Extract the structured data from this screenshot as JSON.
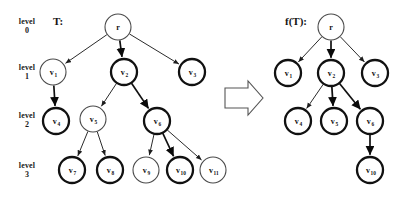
{
  "figure": {
    "level_labels": [
      {
        "line1": "level",
        "line2": "0"
      },
      {
        "line1": "level",
        "line2": "1"
      },
      {
        "line1": "level",
        "line2": "2"
      },
      {
        "line1": "level",
        "line2": "3"
      }
    ],
    "left_tree": {
      "caption": "T:",
      "nodes": [
        {
          "id": "r",
          "base": "r",
          "sub": "",
          "level": 0,
          "x": 118,
          "y": 27,
          "bold": false
        },
        {
          "id": "v1",
          "base": "v",
          "sub": "1",
          "level": 1,
          "x": 53,
          "y": 72,
          "bold": false
        },
        {
          "id": "v2",
          "base": "v",
          "sub": "2",
          "level": 1,
          "x": 124,
          "y": 72,
          "bold": true
        },
        {
          "id": "v3",
          "base": "v",
          "sub": "3",
          "level": 1,
          "x": 192,
          "y": 72,
          "bold": true
        },
        {
          "id": "v4",
          "base": "v",
          "sub": "4",
          "level": 2,
          "x": 56,
          "y": 121,
          "bold": true
        },
        {
          "id": "v5",
          "base": "v",
          "sub": "5",
          "level": 2,
          "x": 93,
          "y": 119,
          "bold": false
        },
        {
          "id": "v6",
          "base": "v",
          "sub": "6",
          "level": 2,
          "x": 157,
          "y": 121,
          "bold": true
        },
        {
          "id": "v7",
          "base": "v",
          "sub": "7",
          "level": 3,
          "x": 72,
          "y": 170,
          "bold": true
        },
        {
          "id": "v8",
          "base": "v",
          "sub": "8",
          "level": 3,
          "x": 110,
          "y": 170,
          "bold": true
        },
        {
          "id": "v9",
          "base": "v",
          "sub": "9",
          "level": 3,
          "x": 146,
          "y": 170,
          "bold": false
        },
        {
          "id": "v10",
          "base": "v",
          "sub": "10",
          "level": 3,
          "x": 180,
          "y": 170,
          "bold": true
        },
        {
          "id": "v11",
          "base": "v",
          "sub": "11",
          "level": 3,
          "x": 213,
          "y": 170,
          "bold": false
        }
      ],
      "edges": [
        {
          "from": "r",
          "to": "v1",
          "bold": false
        },
        {
          "from": "r",
          "to": "v2",
          "bold": true
        },
        {
          "from": "r",
          "to": "v3",
          "bold": false
        },
        {
          "from": "v1",
          "to": "v4",
          "bold": true
        },
        {
          "from": "v2",
          "to": "v5",
          "bold": false
        },
        {
          "from": "v2",
          "to": "v6",
          "bold": true
        },
        {
          "from": "v5",
          "to": "v7",
          "bold": false
        },
        {
          "from": "v5",
          "to": "v8",
          "bold": false
        },
        {
          "from": "v6",
          "to": "v9",
          "bold": false
        },
        {
          "from": "v6",
          "to": "v10",
          "bold": true
        },
        {
          "from": "v6",
          "to": "v11",
          "bold": false
        }
      ]
    },
    "transform_arrow": {
      "name": "right-block-arrow"
    },
    "right_tree": {
      "caption": "f(T):",
      "nodes": [
        {
          "id": "r",
          "base": "r",
          "sub": "",
          "level": 0,
          "x": 331,
          "y": 27,
          "bold": false
        },
        {
          "id": "v1",
          "base": "v",
          "sub": "1",
          "level": 1,
          "x": 288,
          "y": 73,
          "bold": true
        },
        {
          "id": "v2",
          "base": "v",
          "sub": "2",
          "level": 1,
          "x": 331,
          "y": 73,
          "bold": true
        },
        {
          "id": "v3",
          "base": "v",
          "sub": "3",
          "level": 1,
          "x": 375,
          "y": 73,
          "bold": true
        },
        {
          "id": "v4",
          "base": "v",
          "sub": "4",
          "level": 2,
          "x": 298,
          "y": 121,
          "bold": true
        },
        {
          "id": "v5",
          "base": "v",
          "sub": "5",
          "level": 2,
          "x": 334,
          "y": 121,
          "bold": true
        },
        {
          "id": "v6",
          "base": "v",
          "sub": "6",
          "level": 2,
          "x": 370,
          "y": 121,
          "bold": true
        },
        {
          "id": "v10",
          "base": "v",
          "sub": "10",
          "level": 3,
          "x": 370,
          "y": 170,
          "bold": true
        }
      ],
      "edges": [
        {
          "from": "r",
          "to": "v1",
          "bold": false
        },
        {
          "from": "r",
          "to": "v2",
          "bold": true
        },
        {
          "from": "r",
          "to": "v3",
          "bold": false
        },
        {
          "from": "v2",
          "to": "v4",
          "bold": false
        },
        {
          "from": "v2",
          "to": "v5",
          "bold": true
        },
        {
          "from": "v2",
          "to": "v6",
          "bold": true
        },
        {
          "from": "v6",
          "to": "v10",
          "bold": true
        }
      ]
    },
    "style": {
      "node_radius": 13,
      "node_fill": "#ffffff",
      "thin_stroke": "#4a4a4a",
      "thick_stroke": "#111111",
      "edge_color": "#2b2b2b",
      "text_color": "#111111",
      "background": "#ffffff"
    },
    "level_y": [
      27,
      72,
      120,
      170
    ],
    "level_label_x": 10
  }
}
